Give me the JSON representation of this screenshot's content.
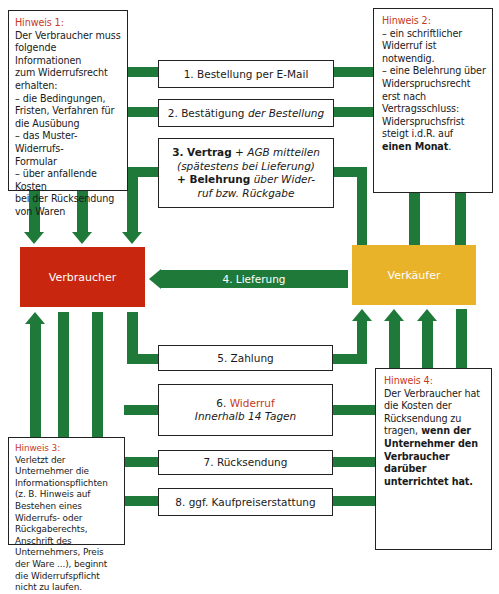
{
  "colors": {
    "connector": "#1f7a3a",
    "consumer": "#c8260f",
    "seller": "#e8b229",
    "accent": "#c8391c"
  },
  "actors": {
    "consumer": "Verbraucher",
    "seller": "Verkäufer"
  },
  "steps": {
    "s1": "1. Bestellung per E-Mail",
    "s2_a": "2. Bestätigung",
    "s2_b": "der Bestellung",
    "s3_a": "3. Vertrag",
    "s3_b": "+ AGB mitteilen",
    "s3_c": "(spätestens bei Lieferung)",
    "s3_d": "+ Belehrung",
    "s3_e": "über Wider-",
    "s3_f": "ruf bzw. Rückgabe",
    "s4": "4. Lieferung",
    "s5": "5. Zahlung",
    "s6_num": "6.",
    "s6_title": "Widerruf",
    "s6_sub": "Innerhalb 14 Tagen",
    "s7": "7. Rücksendung",
    "s8": "8. ggf. Kaufpreiserstattung"
  },
  "notes": {
    "n1": {
      "title": "Hinweis 1:",
      "lines": [
        "Der Verbraucher muss",
        "folgende Informationen",
        "zum Widerrufsrecht",
        "erhalten:",
        "– die Bedingungen,",
        "Fristen, Verfahren für",
        "die Ausübung",
        "– das Muster-Widerrufs-",
        "Formular",
        "– über anfallende Kosten",
        "bei der Rücksendung",
        "von Waren"
      ]
    },
    "n2": {
      "title": "Hinweis 2:",
      "lines": [
        "– ein schriftlicher",
        "Widerruf ist notwendig.",
        "– eine Belehrung über",
        "Widerspruchsrecht",
        "erst nach",
        "Vertragsschluss:",
        "Widerspruchsfrist",
        "steigt i.d.R. auf"
      ],
      "bold_line": "einen Monat",
      "bold_suffix": "."
    },
    "n3": {
      "title": "Hinweis 3:",
      "lines": [
        "Verletzt der",
        "Unternehmer die",
        "Informationspflichten",
        "(z. B. Hinweis auf",
        "Bestehen eines",
        "Widerrufs- oder",
        "Rückgaberechts,",
        "Anschrift des",
        "Unternehmers, Preis",
        "der Ware ...), beginnt",
        "die Widerrufspflicht",
        "nicht zu laufen."
      ]
    },
    "n4": {
      "title": "Hinweis 4:",
      "lines": [
        "Der Verbraucher hat",
        "die Kosten der",
        "Rücksendung zu"
      ],
      "mixed_line_a": "tragen,",
      "mixed_line_b": " wenn der",
      "bold_lines": [
        "Unternehmer den",
        "Verbraucher darüber",
        "unterrichtet hat."
      ]
    }
  }
}
